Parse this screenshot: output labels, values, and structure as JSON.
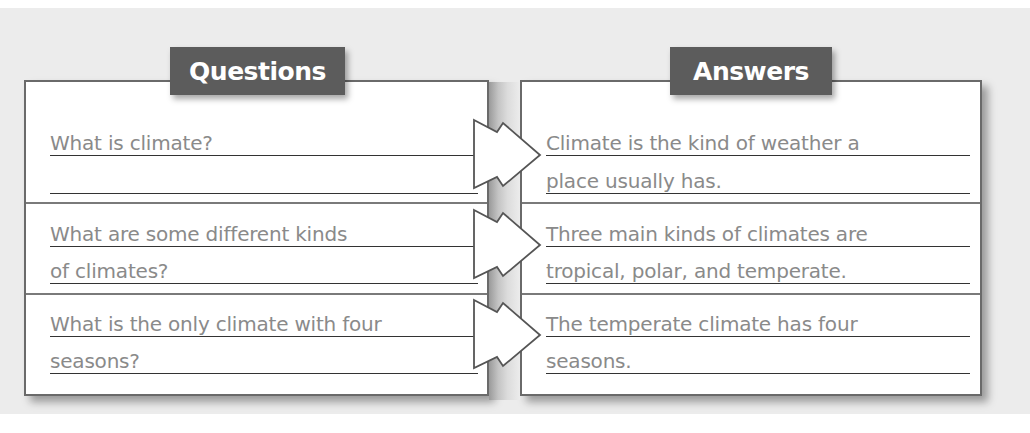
{
  "questions": {
    "title": "Questions",
    "items": [
      {
        "line1": "What is climate?",
        "line2": ""
      },
      {
        "line1": "What are some different kinds",
        "line2": "of climates?"
      },
      {
        "line1": "What is the only climate with four",
        "line2": "seasons?"
      }
    ]
  },
  "answers": {
    "title": "Answers",
    "items": [
      {
        "line1": "Climate is the kind of weather a",
        "line2": "place usually has."
      },
      {
        "line1": "Three main kinds of climates are",
        "line2": "tropical, polar, and temperate."
      },
      {
        "line1": "The temperate climate has four",
        "line2": "seasons."
      }
    ]
  },
  "arrows": {
    "icon": "arrow-right-icon",
    "count": 3
  },
  "colors": {
    "background": "#ececec",
    "label_fill": "#5c5c5c",
    "label_text": "#ffffff",
    "body_text": "#8a8a8a",
    "rule_line": "#333333",
    "border": "#6a6a6a"
  }
}
